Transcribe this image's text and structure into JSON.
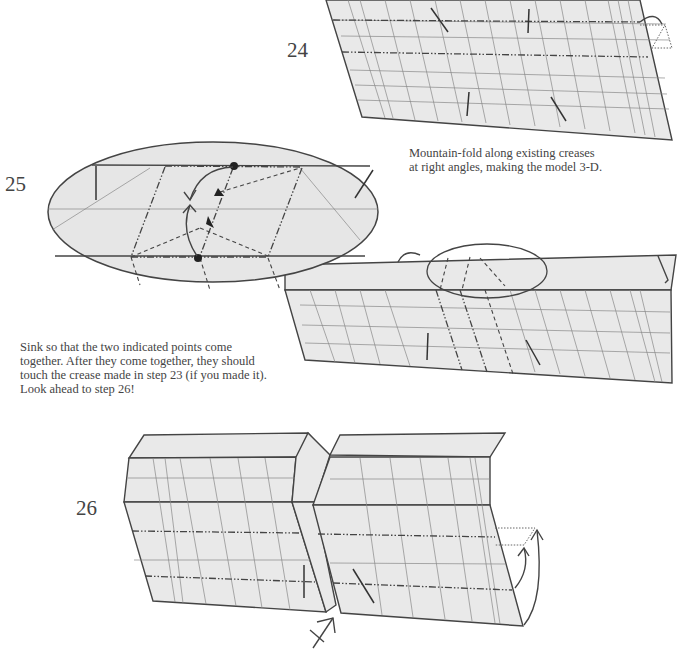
{
  "steps": [
    {
      "number": "24",
      "caption": "Mountain-fold along existing creases\nat right angles, making the model 3-D."
    },
    {
      "number": "25",
      "caption": "Sink so that the two indicated points come\ntogether.  After they come together, they should\ntouch the crease made in step 23 (if  you made it).\nLook ahead to step 26!"
    },
    {
      "number": "26",
      "caption": ""
    }
  ],
  "colors": {
    "paper": "#e9e9e9",
    "line": "#444444",
    "background": "#ffffff"
  }
}
